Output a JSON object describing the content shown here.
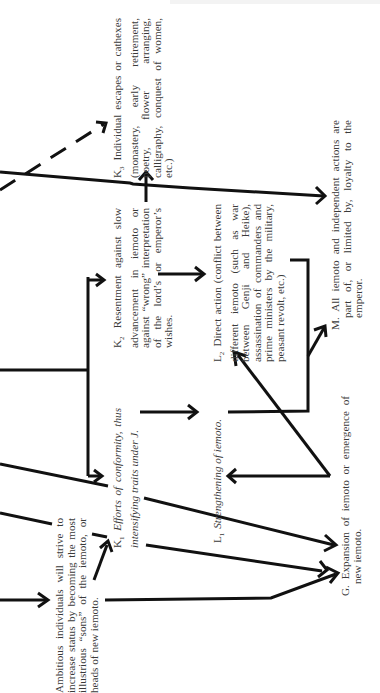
{
  "diagram": {
    "orientation": "rotated-90-ccw",
    "nodes": {
      "ambitious": {
        "label": "",
        "text": "Ambitious individuals will strive to increase status by becoming the most illustrious “sons” of the iemoto, or heads of new iemoto."
      },
      "k1": {
        "label": "K",
        "sub": "1",
        "text": "Efforts of conformity, thus intensifying traits under J."
      },
      "k2": {
        "label": "K",
        "sub": "2",
        "text": "Resentment against slow advancement in iemoto or against “wrong” interpretation of the lord’s or emperor’s wishes."
      },
      "k3": {
        "label": "K",
        "sub": "3",
        "text": "Individual escapes or cathexes (monastery, early retirement, poetry, flower arranging, calligraphy, conquest of women, etc.)"
      },
      "l1": {
        "label": "L",
        "sub": "1",
        "text": "Strengthening of iemoto."
      },
      "l2": {
        "label": "L",
        "sub": "2",
        "text": "Direct action (conflict between different iemoto (such as war between Genji and Heike), assassination of commanders and prime ministers by the military, peasant revolt, etc.)"
      },
      "m": {
        "label": "M.",
        "text": "All iemoto and independent actions are part of, or limited by, loyalty to the emperor."
      },
      "g": {
        "label": "G.",
        "text": "Expansion of iemoto or emergence of new iemoto."
      }
    },
    "edges": [
      {
        "from": "offscreen",
        "to": "ambitious",
        "style": "solid"
      },
      {
        "from": "ambitious",
        "to": "k1",
        "style": "solid"
      },
      {
        "from": "offscreen",
        "to": "k1",
        "style": "solid"
      },
      {
        "from": "offscreen",
        "to": "k2",
        "style": "solid"
      },
      {
        "from": "offscreen",
        "to": "k3",
        "style": "dashed"
      },
      {
        "from": "k2",
        "to": "k3",
        "style": "solid"
      },
      {
        "from": "k1",
        "to": "l1",
        "style": "solid"
      },
      {
        "from": "k2",
        "to": "l2",
        "style": "solid"
      },
      {
        "from": "l1",
        "to": "m",
        "style": "solid"
      },
      {
        "from": "l2",
        "to": "m",
        "style": "solid"
      },
      {
        "from": "offscreen",
        "to": "m",
        "style": "solid"
      },
      {
        "from": "offscreen",
        "to": "g",
        "style": "solid"
      },
      {
        "from": "l1",
        "to": "g",
        "style": "solid"
      },
      {
        "from": "g",
        "to": "l1",
        "style": "solid"
      },
      {
        "from": "g",
        "to": "l2",
        "style": "solid"
      }
    ]
  }
}
